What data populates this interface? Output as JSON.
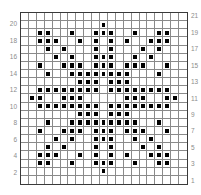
{
  "chart_data": {
    "type": "table",
    "title": "",
    "columns": 21,
    "rows": 21,
    "row_numbering": "bottom-to-top",
    "left_labels": [
      "20",
      "18",
      "16",
      "14",
      "12",
      "10",
      "8",
      "6",
      "4",
      "2"
    ],
    "right_labels": [
      "21",
      "19",
      "17",
      "15",
      "13",
      "11",
      "9",
      "7",
      "5",
      "3",
      "1"
    ],
    "filled_cells_by_row": {
      "21": [],
      "20": [
        11
      ],
      "19": [
        3,
        4,
        7,
        10,
        11,
        12,
        15,
        18,
        19
      ],
      "18": [
        3,
        4,
        5,
        8,
        10,
        12,
        14,
        17,
        18,
        19
      ],
      "17": [
        4,
        6,
        10,
        12,
        16,
        18
      ],
      "16": [
        5,
        7,
        10,
        11,
        12,
        15,
        17
      ],
      "15": [
        3,
        6,
        7,
        8,
        10,
        11,
        12,
        14,
        15,
        16,
        19
      ],
      "14": [
        4,
        7,
        8,
        9,
        10,
        11,
        12,
        13,
        14,
        18
      ],
      "13": [
        8,
        9,
        10,
        12,
        13,
        14
      ],
      "12": [
        3,
        4,
        5,
        6,
        7,
        8,
        9,
        10,
        12,
        13,
        14,
        15,
        16,
        17,
        18,
        19
      ],
      "11": [
        2,
        3,
        6,
        7,
        8,
        14,
        15,
        16,
        19,
        20
      ],
      "10": [
        3,
        4,
        5,
        6,
        7,
        8,
        9,
        10,
        12,
        13,
        14,
        15,
        16,
        17,
        18,
        19
      ],
      "9": [
        8,
        9,
        10,
        12,
        13,
        14
      ],
      "8": [
        4,
        7,
        8,
        9,
        10,
        11,
        12,
        13,
        14,
        15,
        18
      ],
      "7": [
        3,
        6,
        7,
        8,
        10,
        11,
        12,
        14,
        15,
        16,
        19
      ],
      "6": [
        5,
        7,
        10,
        11,
        12,
        15,
        17
      ],
      "5": [
        4,
        6,
        10,
        12,
        16,
        18
      ],
      "4": [
        3,
        4,
        5,
        8,
        10,
        12,
        14,
        17,
        18,
        19
      ],
      "3": [
        3,
        4,
        7,
        10,
        11,
        12,
        15,
        18,
        19
      ],
      "2": [
        11
      ],
      "1": []
    },
    "colors": {
      "filled": "#000000",
      "empty": "#ffffff",
      "gridline": "#8a8a8a",
      "label": "#8c8c8c"
    }
  }
}
